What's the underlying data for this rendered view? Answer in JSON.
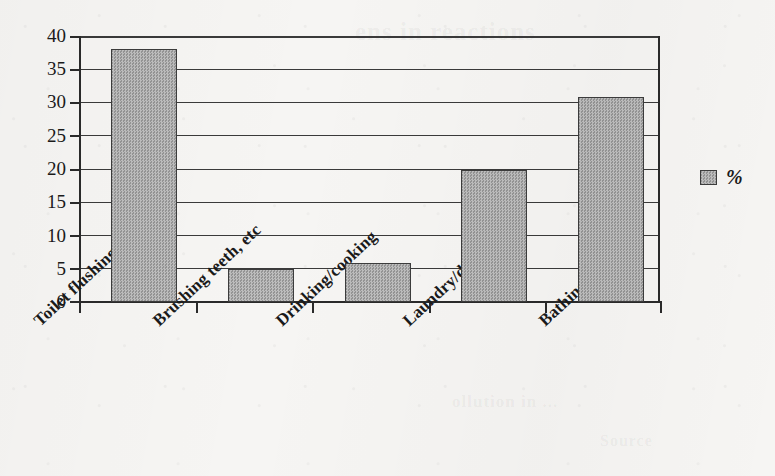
{
  "chart_data": {
    "type": "bar",
    "title": "",
    "xlabel": "",
    "ylabel": "",
    "categories": [
      "Toilet flushing",
      "Brushing teeth, etc",
      "Drinking/cooking",
      "Laundry/dishes",
      "Bathing"
    ],
    "values": [
      38,
      4.9,
      5.8,
      19.8,
      30.8
    ],
    "series": [
      {
        "name": "%",
        "values": [
          38,
          4.9,
          5.8,
          19.8,
          30.8
        ]
      }
    ],
    "ylim": [
      0,
      40
    ],
    "ytick_step": 5,
    "yticks": [
      "40",
      "35",
      "30",
      "25",
      "20",
      "15",
      "10",
      "5",
      "0"
    ],
    "grid": "horizontal",
    "legend_position": "right",
    "legend_entries": [
      "%"
    ],
    "bar_color": "#a9a9a9",
    "bar_border_color": "#3c3c3c",
    "axis_color": "#2a2a2a",
    "background_color": "#f6f5f3"
  },
  "legend": {
    "swatch_name": "percent-series-swatch",
    "label": "%"
  },
  "ghost_text": {
    "top": "ens in reactions",
    "mid_left": "ollution in ...",
    "bottom": "Source"
  }
}
